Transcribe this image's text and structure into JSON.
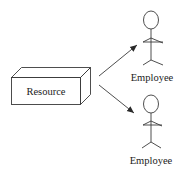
{
  "diagram": {
    "resource": {
      "label": "Resource",
      "shape": "3d-box"
    },
    "actors": [
      {
        "label": "Employee",
        "shape": "stick-figure"
      },
      {
        "label": "Employee",
        "shape": "stick-figure"
      }
    ],
    "edges": [
      {
        "from": "Resource",
        "to": "Employee (top)",
        "type": "arrow"
      },
      {
        "from": "Resource",
        "to": "Employee (bottom)",
        "type": "arrow"
      }
    ],
    "colors": {
      "line": "#3a3a3a",
      "text": "#222222",
      "background": "#ffffff"
    }
  }
}
